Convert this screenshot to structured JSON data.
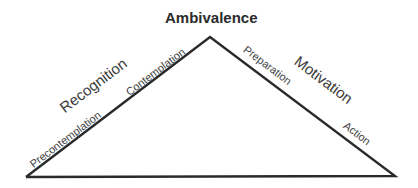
{
  "diagram": {
    "apex_label": "Ambivalence",
    "left_side": {
      "phase": "Recognition",
      "stages": [
        "Precontemplation",
        "Contemplation"
      ]
    },
    "right_side": {
      "phase": "Motivation",
      "stages": [
        "Preparation",
        "Action"
      ]
    },
    "colors": {
      "line": "#2a2a2a",
      "text": "#3a3a3a",
      "background": "#ffffff"
    }
  }
}
